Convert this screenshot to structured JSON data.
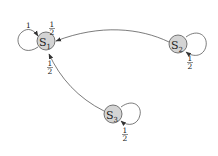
{
  "diagram": {
    "type": "state-transition-graph",
    "nodes": [
      {
        "id": "S1",
        "label": "S",
        "subscript": "1"
      },
      {
        "id": "S2",
        "label": "S",
        "subscript": "2"
      },
      {
        "id": "S3",
        "label": "S",
        "subscript": "3"
      }
    ],
    "edges": [
      {
        "from": "S1",
        "to": "S1",
        "label": "1"
      },
      {
        "from": "S2",
        "to": "S1",
        "label_num": "1",
        "label_den": "2"
      },
      {
        "from": "S2",
        "to": "S2",
        "label_num": "1",
        "label_den": "2"
      },
      {
        "from": "S3",
        "to": "S1",
        "label_num": "1",
        "label_den": "2"
      },
      {
        "from": "S3",
        "to": "S3",
        "label_num": "1",
        "label_den": "2"
      }
    ],
    "node_fill": "#d4d4d4"
  }
}
